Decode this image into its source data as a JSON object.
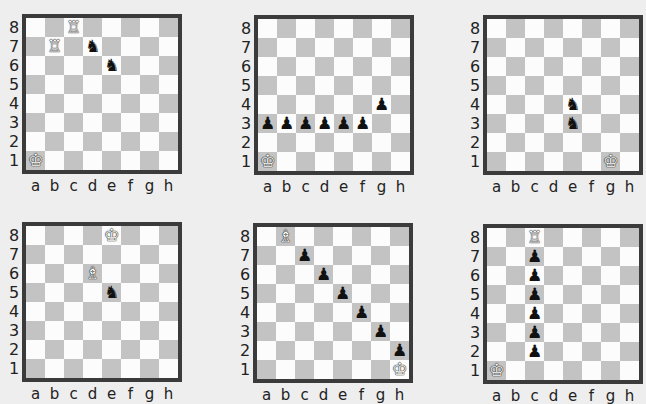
{
  "files": [
    "a",
    "b",
    "c",
    "d",
    "e",
    "f",
    "g",
    "h"
  ],
  "ranks": [
    "8",
    "7",
    "6",
    "5",
    "4",
    "3",
    "2",
    "1"
  ],
  "diagrams": [
    {
      "id": 1,
      "pieces": [
        {
          "square": "c8",
          "type": "rook",
          "color": "white"
        },
        {
          "square": "b7",
          "type": "rook",
          "color": "white"
        },
        {
          "square": "d7",
          "type": "knight",
          "color": "black"
        },
        {
          "square": "e6",
          "type": "knight",
          "color": "black"
        },
        {
          "square": "a1",
          "type": "king",
          "color": "white"
        }
      ]
    },
    {
      "id": 2,
      "pieces": [
        {
          "square": "g4",
          "type": "pawn",
          "color": "black"
        },
        {
          "square": "a3",
          "type": "pawn",
          "color": "black"
        },
        {
          "square": "b3",
          "type": "pawn",
          "color": "black"
        },
        {
          "square": "c3",
          "type": "pawn",
          "color": "black"
        },
        {
          "square": "d3",
          "type": "pawn",
          "color": "black"
        },
        {
          "square": "e3",
          "type": "pawn",
          "color": "black"
        },
        {
          "square": "f3",
          "type": "pawn",
          "color": "black"
        },
        {
          "square": "a1",
          "type": "king",
          "color": "white"
        }
      ]
    },
    {
      "id": 3,
      "pieces": [
        {
          "square": "e4",
          "type": "knight",
          "color": "black"
        },
        {
          "square": "e3",
          "type": "knight",
          "color": "black"
        },
        {
          "square": "g1",
          "type": "king",
          "color": "white"
        }
      ]
    },
    {
      "id": 4,
      "pieces": [
        {
          "square": "e8",
          "type": "king",
          "color": "white"
        },
        {
          "square": "d6",
          "type": "bishop",
          "color": "white"
        },
        {
          "square": "e5",
          "type": "knight",
          "color": "black"
        }
      ]
    },
    {
      "id": 5,
      "pieces": [
        {
          "square": "b8",
          "type": "bishop",
          "color": "white"
        },
        {
          "square": "c7",
          "type": "pawn",
          "color": "black"
        },
        {
          "square": "d6",
          "type": "pawn",
          "color": "black"
        },
        {
          "square": "e5",
          "type": "pawn",
          "color": "black"
        },
        {
          "square": "f4",
          "type": "pawn",
          "color": "black"
        },
        {
          "square": "g3",
          "type": "pawn",
          "color": "black"
        },
        {
          "square": "h2",
          "type": "pawn",
          "color": "black"
        },
        {
          "square": "h1",
          "type": "king",
          "color": "white"
        }
      ]
    },
    {
      "id": 6,
      "pieces": [
        {
          "square": "c8",
          "type": "rook",
          "color": "white"
        },
        {
          "square": "c7",
          "type": "pawn",
          "color": "black"
        },
        {
          "square": "c6",
          "type": "pawn",
          "color": "black"
        },
        {
          "square": "c5",
          "type": "pawn",
          "color": "black"
        },
        {
          "square": "c4",
          "type": "pawn",
          "color": "black"
        },
        {
          "square": "c3",
          "type": "pawn",
          "color": "black"
        },
        {
          "square": "c2",
          "type": "pawn",
          "color": "black"
        },
        {
          "square": "a1",
          "type": "king",
          "color": "white"
        }
      ]
    }
  ],
  "colors": {
    "background": "#eeeeee",
    "light_square": "#fcfcfc",
    "dark_square": "#c3c3c3",
    "border": "#3b3b3b"
  },
  "glyphs": {
    "white": {
      "king": "♔",
      "queen": "♕",
      "rook": "♖",
      "bishop": "♗",
      "knight": "♘",
      "pawn": "♙"
    },
    "black": {
      "king": "♚",
      "queen": "♛",
      "rook": "♜",
      "bishop": "♝",
      "knight": "♞",
      "pawn": "♟"
    }
  }
}
